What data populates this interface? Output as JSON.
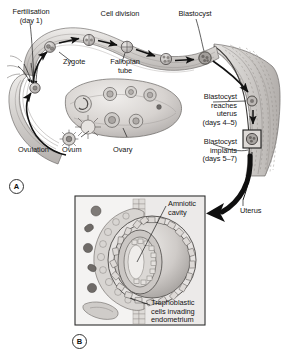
{
  "figure": {
    "panels": [
      {
        "id": "A",
        "label": "A",
        "caption": "Ovary, fallopian tube and uterus showing ovulation, fertilisation, cell division and implantation"
      },
      {
        "id": "B",
        "label": "B",
        "caption": "Detail of the implanting blastocyst within the endometrium"
      }
    ]
  },
  "panel_a": {
    "labels": {
      "fertilisation": "Fertilisation\n(day 1)",
      "cell_division": "Cell division",
      "blastocyst": "Blastocyst",
      "zygote": "Zygote",
      "fallopian_tube": "Fallopian\ntube",
      "ovulation": "Ovulation",
      "ovum": "Ovum",
      "ovary": "Ovary",
      "blastocyst_reaches": "Blastocyst\nreaches\nuterus\n(days 4–5)",
      "blastocyst_implants": "Blastocyst\nimplants\n(days 5–7)",
      "uterus": "Uterus"
    },
    "stages": [
      {
        "name": "zygote",
        "cells": 1
      },
      {
        "name": "two-cell",
        "cells": 2
      },
      {
        "name": "four-cell",
        "cells": 4
      },
      {
        "name": "morula",
        "cells": 8
      },
      {
        "name": "blastocyst",
        "cells": 16
      }
    ]
  },
  "panel_b": {
    "labels": {
      "amniotic_cavity": "Amniotic\ncavity",
      "trophoblast": "Trophoblastic\ncells invading\nendometrium"
    }
  },
  "colors": {
    "ink": "#141414",
    "outline": "#4a4a4a",
    "tissue_light": "#e4e2e0",
    "tissue_mid": "#c9c6c3",
    "tissue_dark": "#a5a1a0",
    "cell_fill": "#bdb9b7",
    "arrow": "#111111",
    "frame": "#3a3a3a"
  }
}
